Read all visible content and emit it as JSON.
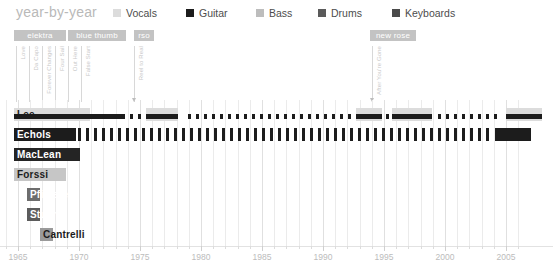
{
  "header": {
    "title": "year-by-year",
    "legend": [
      {
        "label": "Vocals",
        "color": "#dcdcdc",
        "x": 113
      },
      {
        "label": "Guitar",
        "color": "#1c1c1c",
        "x": 186
      },
      {
        "label": "Bass",
        "color": "#bdbdbd",
        "x": 256
      },
      {
        "label": "Drums",
        "color": "#5a5a5a",
        "x": 318
      },
      {
        "label": "Keyboards",
        "color": "#4a4a4a",
        "x": 392
      }
    ]
  },
  "annotations": {
    "record_labels": [
      {
        "text": "elektra",
        "x": 14,
        "width": 52
      },
      {
        "text": "blue thumb",
        "x": 68,
        "width": 58
      },
      {
        "text": "rso",
        "x": 134,
        "width": 20
      },
      {
        "text": "new rose",
        "x": 370,
        "width": 46
      }
    ],
    "albums": [
      {
        "text": "Love",
        "x": 16
      },
      {
        "text": "Da Capo",
        "x": 29
      },
      {
        "text": "Forever Changes",
        "x": 42
      },
      {
        "text": "Four Sail",
        "x": 55
      },
      {
        "text": "Out Here",
        "x": 68
      },
      {
        "text": "False Start",
        "x": 81
      },
      {
        "text": "Reel to Real",
        "x": 134
      },
      {
        "text": "After You're Gone",
        "x": 372
      }
    ]
  },
  "chart_data": {
    "type": "timeline",
    "title": "year-by-year",
    "xlabel": "",
    "ylabel": "",
    "xlim": [
      1964,
      2006
    ],
    "x_ticks": [
      1965,
      1970,
      1975,
      1980,
      1985,
      1990,
      1995,
      2000,
      2005
    ],
    "grid": true,
    "legend_position": "top",
    "members": [
      {
        "name": "Lee",
        "bar_color": "#d2d2d2",
        "text_color": "#1c1c1c",
        "bar_start": 14,
        "bar_width": 76,
        "instruments": [
          "Vocals",
          "Guitar"
        ]
      },
      {
        "name": "Echols",
        "bar_color": "#1c1c1c",
        "text_color": "#ffffff",
        "bar_start": 14,
        "bar_width": 62,
        "instruments": [
          "Guitar"
        ]
      },
      {
        "name": "MacLean",
        "bar_color": "#242424",
        "text_color": "#ffffff",
        "bar_start": 14,
        "bar_width": 66,
        "instruments": [
          "Guitar",
          "Vocals"
        ]
      },
      {
        "name": "Forssi",
        "bar_color": "#c6c6c6",
        "text_color": "#1c1c1c",
        "bar_start": 14,
        "bar_width": 52,
        "instruments": [
          "Bass"
        ]
      },
      {
        "name": "Pfisterer",
        "bar_color": "#6d6d6d",
        "text_color": "#ffffff",
        "bar_start": 27,
        "bar_width": 13,
        "instruments": [
          "Drums"
        ]
      },
      {
        "name": "Stuart",
        "bar_color": "#5c5c5c",
        "text_color": "#ffffff",
        "bar_start": 27,
        "bar_width": 13,
        "instruments": [
          "Drums"
        ]
      },
      {
        "name": "Cantrelli",
        "bar_color": "#9a9a9a",
        "text_color": "#1c1c1c",
        "bar_start": 40,
        "bar_width": 13,
        "instruments": [
          "Keyboards"
        ]
      }
    ],
    "series": [
      {
        "name": "Lee",
        "row": 0,
        "segments": [
          {
            "x": 14,
            "w": 76,
            "h": 13,
            "y": 0,
            "color": "#dcdcdc"
          },
          {
            "x": 14,
            "w": 76,
            "h": 5,
            "y": 6,
            "color": "#1c1c1c"
          },
          {
            "x": 90,
            "w": 35,
            "h": 5,
            "y": 6,
            "color": "#1c1c1c"
          },
          {
            "x": 130,
            "w": 3,
            "h": 5,
            "y": 6,
            "color": "#1c1c1c"
          },
          {
            "x": 138,
            "w": 3,
            "h": 5,
            "y": 6,
            "color": "#1c1c1c"
          },
          {
            "x": 146,
            "w": 32,
            "h": 13,
            "y": 0,
            "color": "#dcdcdc"
          },
          {
            "x": 146,
            "w": 32,
            "h": 5,
            "y": 6,
            "color": "#1c1c1c"
          },
          {
            "x": 188,
            "w": 3,
            "h": 5,
            "y": 6,
            "color": "#1c1c1c"
          },
          {
            "x": 196,
            "w": 3,
            "h": 5,
            "y": 6,
            "color": "#1c1c1c"
          },
          {
            "x": 204,
            "w": 3,
            "h": 5,
            "y": 6,
            "color": "#1c1c1c"
          },
          {
            "x": 212,
            "w": 3,
            "h": 5,
            "y": 6,
            "color": "#1c1c1c"
          },
          {
            "x": 220,
            "w": 3,
            "h": 5,
            "y": 6,
            "color": "#1c1c1c"
          },
          {
            "x": 228,
            "w": 3,
            "h": 5,
            "y": 6,
            "color": "#1c1c1c"
          },
          {
            "x": 236,
            "w": 3,
            "h": 5,
            "y": 6,
            "color": "#1c1c1c"
          },
          {
            "x": 244,
            "w": 3,
            "h": 5,
            "y": 6,
            "color": "#1c1c1c"
          },
          {
            "x": 252,
            "w": 3,
            "h": 5,
            "y": 6,
            "color": "#1c1c1c"
          },
          {
            "x": 260,
            "w": 3,
            "h": 5,
            "y": 6,
            "color": "#1c1c1c"
          },
          {
            "x": 268,
            "w": 3,
            "h": 5,
            "y": 6,
            "color": "#1c1c1c"
          },
          {
            "x": 276,
            "w": 3,
            "h": 5,
            "y": 6,
            "color": "#1c1c1c"
          },
          {
            "x": 284,
            "w": 3,
            "h": 5,
            "y": 6,
            "color": "#1c1c1c"
          },
          {
            "x": 292,
            "w": 3,
            "h": 5,
            "y": 6,
            "color": "#1c1c1c"
          },
          {
            "x": 300,
            "w": 3,
            "h": 5,
            "y": 6,
            "color": "#1c1c1c"
          },
          {
            "x": 308,
            "w": 3,
            "h": 5,
            "y": 6,
            "color": "#1c1c1c"
          },
          {
            "x": 316,
            "w": 3,
            "h": 5,
            "y": 6,
            "color": "#1c1c1c"
          },
          {
            "x": 324,
            "w": 3,
            "h": 5,
            "y": 6,
            "color": "#1c1c1c"
          },
          {
            "x": 332,
            "w": 3,
            "h": 5,
            "y": 6,
            "color": "#1c1c1c"
          },
          {
            "x": 340,
            "w": 3,
            "h": 5,
            "y": 6,
            "color": "#1c1c1c"
          },
          {
            "x": 348,
            "w": 3,
            "h": 5,
            "y": 6,
            "color": "#1c1c1c"
          },
          {
            "x": 356,
            "w": 26,
            "h": 13,
            "y": 0,
            "color": "#dcdcdc"
          },
          {
            "x": 356,
            "w": 26,
            "h": 5,
            "y": 6,
            "color": "#1c1c1c"
          },
          {
            "x": 386,
            "w": 3,
            "h": 5,
            "y": 6,
            "color": "#1c1c1c"
          },
          {
            "x": 392,
            "w": 40,
            "h": 13,
            "y": 0,
            "color": "#dcdcdc"
          },
          {
            "x": 392,
            "w": 40,
            "h": 5,
            "y": 6,
            "color": "#1c1c1c"
          },
          {
            "x": 438,
            "w": 3,
            "h": 5,
            "y": 6,
            "color": "#1c1c1c"
          },
          {
            "x": 446,
            "w": 3,
            "h": 5,
            "y": 6,
            "color": "#1c1c1c"
          },
          {
            "x": 454,
            "w": 3,
            "h": 5,
            "y": 6,
            "color": "#1c1c1c"
          },
          {
            "x": 462,
            "w": 3,
            "h": 5,
            "y": 6,
            "color": "#1c1c1c"
          },
          {
            "x": 470,
            "w": 3,
            "h": 5,
            "y": 6,
            "color": "#1c1c1c"
          },
          {
            "x": 478,
            "w": 3,
            "h": 5,
            "y": 6,
            "color": "#1c1c1c"
          },
          {
            "x": 486,
            "w": 3,
            "h": 5,
            "y": 6,
            "color": "#1c1c1c"
          },
          {
            "x": 494,
            "w": 3,
            "h": 5,
            "y": 6,
            "color": "#1c1c1c"
          },
          {
            "x": 506,
            "w": 36,
            "h": 13,
            "y": 0,
            "color": "#dcdcdc"
          },
          {
            "x": 506,
            "w": 36,
            "h": 5,
            "y": 6,
            "color": "#1c1c1c"
          }
        ]
      },
      {
        "name": "Echols",
        "row": 1,
        "segments": [
          {
            "x": 14,
            "w": 62,
            "h": 13,
            "y": 0,
            "color": "#1c1c1c"
          },
          {
            "x": 495,
            "w": 36,
            "h": 13,
            "y": 0,
            "color": "#1c1c1c"
          }
        ],
        "ticks": {
          "start": 78,
          "end": 492,
          "step": 8,
          "w": 3,
          "h": 13,
          "y": 0,
          "color": "#1c1c1c"
        }
      },
      {
        "name": "MacLean",
        "row": 2,
        "segments": [
          {
            "x": 14,
            "w": 66,
            "h": 13,
            "y": 0,
            "color": "#242424"
          }
        ]
      },
      {
        "name": "Forssi",
        "row": 3,
        "segments": [
          {
            "x": 14,
            "w": 52,
            "h": 13,
            "y": 0,
            "color": "#c6c6c6"
          }
        ]
      },
      {
        "name": "Pfisterer",
        "row": 4,
        "segments": [
          {
            "x": 27,
            "w": 13,
            "h": 13,
            "y": 0,
            "color": "#6d6d6d"
          }
        ]
      },
      {
        "name": "Stuart",
        "row": 5,
        "segments": [
          {
            "x": 27,
            "w": 13,
            "h": 13,
            "y": 0,
            "color": "#5c5c5c"
          }
        ]
      },
      {
        "name": "Cantrelli",
        "row": 6,
        "segments": [
          {
            "x": 40,
            "w": 13,
            "h": 13,
            "y": 0,
            "color": "#9a9a9a"
          }
        ]
      }
    ]
  },
  "axis": {
    "year_start": 1964,
    "year_end": 2006,
    "px_per_year": 12.2,
    "x_origin": 18,
    "labels": [
      "1965",
      "1970",
      "1975",
      "1980",
      "1985",
      "1990",
      "1995",
      "2000",
      "2005"
    ]
  }
}
